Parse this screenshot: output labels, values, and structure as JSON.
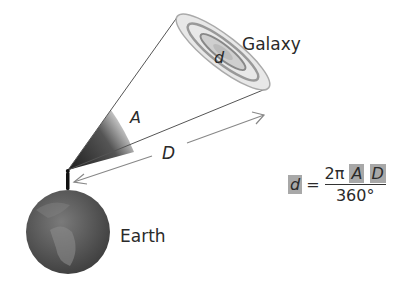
{
  "labels": {
    "galaxy": "Galaxy",
    "earth": "Earth",
    "angle": "A",
    "distance": "D",
    "diameter": "d"
  },
  "formula": {
    "lhs": "d",
    "equals": "=",
    "numerator_coef": "2π",
    "numerator_a": "A",
    "numerator_d": "D",
    "denominator": "360°"
  },
  "colors": {
    "highlight": "#a8a8a8",
    "earth": "#5a5a5a",
    "line": "#6a6a6a"
  }
}
